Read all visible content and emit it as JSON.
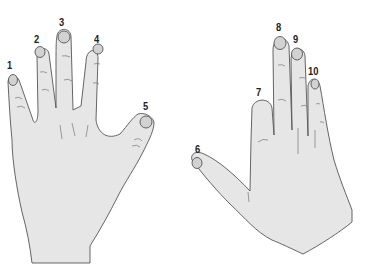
{
  "figure": {
    "left_hand": {
      "fingers": [
        {
          "number": "1",
          "x": 7,
          "y": 60
        },
        {
          "number": "2",
          "x": 34,
          "y": 34
        },
        {
          "number": "3",
          "x": 59,
          "y": 17
        },
        {
          "number": "4",
          "x": 94,
          "y": 34
        },
        {
          "number": "5",
          "x": 143,
          "y": 101
        }
      ]
    },
    "right_hand": {
      "fingers": [
        {
          "number": "6",
          "x": 195,
          "y": 146
        },
        {
          "number": "7",
          "x": 256,
          "y": 89
        },
        {
          "number": "8",
          "x": 276,
          "y": 22
        },
        {
          "number": "9",
          "x": 293,
          "y": 34
        },
        {
          "number": "10",
          "x": 308,
          "y": 66
        }
      ]
    },
    "colors": {
      "skin": "#e6e6e6",
      "nail": "#d2d2d2",
      "outline": "#555555",
      "label": "#222222"
    }
  }
}
